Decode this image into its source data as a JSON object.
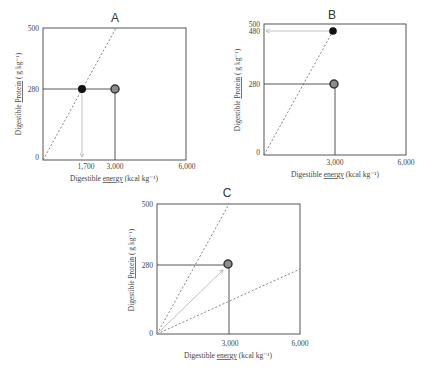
{
  "panels": [
    {
      "id": "A",
      "title": "A",
      "ylabel_parts": [
        "Digestible",
        "Protein",
        "( g kg⁻¹)"
      ],
      "xlabel_parts": [
        "Digestible",
        "energy",
        "(kcal kg⁻¹)"
      ],
      "y_ticks": [
        "0",
        "280",
        "500"
      ],
      "x_ticks": [
        "1,700",
        "3,000",
        "6,000"
      ]
    },
    {
      "id": "B",
      "title": "B",
      "ylabel_parts": [
        "Digestible",
        "Protein",
        "( g kg⁻¹)"
      ],
      "xlabel_parts": [
        "Digestible",
        "energy",
        "(kcal kg⁻¹)"
      ],
      "y_ticks": [
        "0",
        "280",
        "480",
        "500"
      ],
      "x_ticks": [
        "3,000",
        "6,000"
      ]
    },
    {
      "id": "C",
      "title": "C",
      "ylabel_parts": [
        "Digestible",
        "Protein",
        "( g kg⁻¹)"
      ],
      "xlabel_parts": [
        "Digestible",
        "energy",
        "(kcal kg⁻¹)"
      ],
      "y_ticks": [
        "0",
        "280",
        "500"
      ],
      "x_ticks": [
        "3,000",
        "6,000"
      ]
    }
  ],
  "colors": {
    "frame": "#555555",
    "dashed": "#666666",
    "arrow": "#bbbbbb",
    "black_point": "#111111",
    "grey_point_fill": "#8c8c8c",
    "grey_point_stroke": "#333333"
  }
}
